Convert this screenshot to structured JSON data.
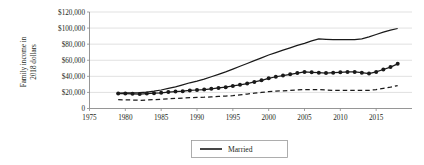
{
  "chart_data": {
    "type": "line",
    "title": "",
    "xlabel": "",
    "ylabel": "Family income in 2018 dollars",
    "xlim": [
      1975,
      2020
    ],
    "ylim": [
      0,
      120000
    ],
    "grid": true,
    "legend_position": "bottom-center",
    "y_ticks": [
      0,
      20000,
      40000,
      60000,
      80000,
      100000,
      120000
    ],
    "y_tick_labels": [
      "0",
      "$20,000",
      "$40,000",
      "$60,000",
      "$80,000",
      "$100,000",
      "$120,000"
    ],
    "x_ticks": [
      1975,
      1980,
      1985,
      1990,
      1995,
      2000,
      2005,
      2010,
      2015
    ],
    "x_tick_labels": [
      "1975",
      "1980",
      "1985",
      "1990",
      "1995",
      "2000",
      "2005",
      "2010",
      "2015"
    ],
    "x": [
      1979,
      1980,
      1981,
      1982,
      1983,
      1984,
      1985,
      1986,
      1987,
      1988,
      1989,
      1990,
      1991,
      1992,
      1993,
      1994,
      1995,
      1996,
      1997,
      1998,
      1999,
      2000,
      2001,
      2002,
      2003,
      2004,
      2005,
      2006,
      2007,
      2008,
      2009,
      2010,
      2011,
      2012,
      2013,
      2014,
      2015,
      2016,
      2017,
      2018
    ],
    "series": [
      {
        "name": "Married",
        "style": "solid",
        "marker": "none",
        "color": "#1a1a1a",
        "values": [
          19000,
          19500,
          19500,
          19800,
          20500,
          21500,
          23000,
          25000,
          27000,
          29500,
          32000,
          34000,
          36500,
          39500,
          42500,
          45500,
          49000,
          52500,
          56000,
          59500,
          63000,
          66500,
          69500,
          72500,
          75500,
          78500,
          81000,
          84000,
          86500,
          86000,
          85500,
          85500,
          85500,
          85500,
          86500,
          89000,
          92000,
          95000,
          97500,
          99500
        ]
      },
      {
        "name": "series-markers",
        "style": "solid",
        "marker": "diamond",
        "color": "#1a1a1a",
        "values": [
          18500,
          18500,
          18200,
          18000,
          18500,
          19000,
          19500,
          20500,
          21000,
          21500,
          22500,
          23000,
          23500,
          24500,
          25500,
          26500,
          28000,
          29500,
          31000,
          33000,
          35000,
          37500,
          39500,
          41000,
          42500,
          44000,
          45500,
          45000,
          44500,
          44000,
          44500,
          45000,
          45500,
          45500,
          44500,
          43500,
          45500,
          48500,
          51500,
          55500
        ]
      },
      {
        "name": "series-dashed",
        "style": "dashed",
        "marker": "none",
        "color": "#1a1a1a",
        "values": [
          11000,
          10800,
          10500,
          10200,
          10500,
          11000,
          11500,
          12000,
          12500,
          13000,
          13500,
          13800,
          14000,
          14500,
          15000,
          15500,
          16000,
          17000,
          18000,
          19000,
          20000,
          21000,
          21500,
          22000,
          22500,
          23000,
          23500,
          23500,
          23500,
          23000,
          22500,
          22500,
          22500,
          22500,
          22500,
          22500,
          23500,
          25000,
          26500,
          28500
        ]
      }
    ],
    "legend": [
      {
        "label": "Married",
        "style": "solid",
        "color": "#1a1a1a"
      }
    ]
  }
}
